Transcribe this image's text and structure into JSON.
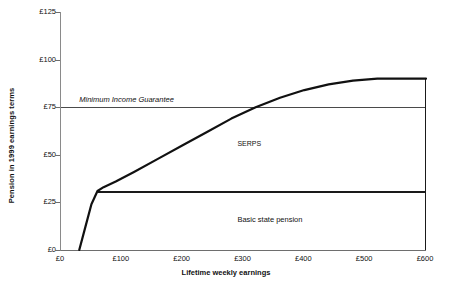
{
  "chart_data": {
    "type": "line",
    "title": "",
    "xlabel": "Lifetime weekly earnings",
    "ylabel": "Pension in 1999 earnings terms",
    "xlim": [
      0,
      600
    ],
    "ylim": [
      0,
      125
    ],
    "grid": false,
    "legend_position": "inline-annotations",
    "xticks": [
      "£0",
      "£100",
      "£200",
      "£300",
      "£400",
      "£500",
      "£600"
    ],
    "xtick_values": [
      0,
      100,
      200,
      300,
      400,
      500,
      600
    ],
    "yticks": [
      "£0",
      "£25",
      "£50",
      "£75",
      "£100",
      "£125"
    ],
    "ytick_values": [
      0,
      25,
      50,
      75,
      100,
      125
    ],
    "annotations": [
      {
        "name": "minimum-income-guarantee",
        "text": "Minimum Income Guarantee",
        "x": 30,
        "y": 78,
        "style": "italic"
      },
      {
        "name": "serps",
        "text": "SERPS",
        "x": 290,
        "y": 55,
        "style": "normal"
      },
      {
        "name": "basic-state-pension",
        "text": "Basic state pension",
        "x": 290,
        "y": 16,
        "style": "normal"
      }
    ],
    "series": [
      {
        "name": "Total pension",
        "style": "thick-line",
        "color": "#111111",
        "x": [
          30,
          40,
          50,
          60,
          70,
          90,
          120,
          160,
          200,
          240,
          280,
          320,
          360,
          400,
          440,
          480,
          520,
          560,
          600
        ],
        "y": [
          0,
          12,
          24,
          31,
          33,
          36,
          41,
          48,
          55,
          62,
          69,
          75,
          80,
          84,
          87,
          89,
          90,
          90,
          90
        ]
      },
      {
        "name": "Basic state pension",
        "style": "flat-line",
        "color": "#1a1a1a",
        "x": [
          60,
          600
        ],
        "y": [
          31,
          31
        ]
      },
      {
        "name": "Minimum Income Guarantee",
        "style": "thin-line",
        "color": "#4a4a4a",
        "x": [
          0,
          600
        ],
        "y": [
          75,
          75
        ]
      }
    ]
  }
}
